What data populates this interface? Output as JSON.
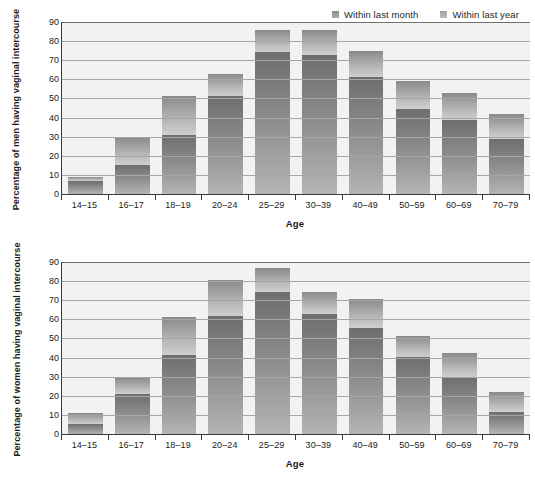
{
  "legend": {
    "items": [
      {
        "label": "Within last month",
        "key": "month",
        "color": "#8b8b89",
        "icon": "legend-swatch-icon"
      },
      {
        "label": "Within last year",
        "key": "year",
        "color": "#b9b9b7",
        "icon": "legend-swatch-icon"
      }
    ]
  },
  "chart_data": [
    {
      "type": "bar",
      "stacked": true,
      "panel": "men",
      "title": "",
      "xlabel": "Age",
      "ylabel": "Percentage of men having vaginal intercourse",
      "categories": [
        "14–15",
        "16–17",
        "18–19",
        "20–24",
        "25–29",
        "30–39",
        "40–49",
        "50–59",
        "60–69",
        "70–79"
      ],
      "ylim": [
        0,
        90
      ],
      "yticks": [
        0,
        10,
        20,
        30,
        40,
        50,
        60,
        70,
        80,
        90
      ],
      "grid": true,
      "legend_position": "top-right",
      "series": [
        {
          "name": "Within last month",
          "values": [
            7,
            15,
            31,
            51.5,
            74.5,
            72.5,
            61,
            44.5,
            38.5,
            29
          ]
        },
        {
          "name": "Within last year",
          "values": [
            9,
            30,
            51.5,
            63,
            86,
            86,
            75,
            59,
            53,
            42
          ]
        }
      ],
      "note": "'Within last year' values are cumulative bar totals; the upper lighter segment is the difference."
    },
    {
      "type": "bar",
      "stacked": true,
      "panel": "women",
      "title": "",
      "xlabel": "Age",
      "ylabel": "Percentage of women having vaginal intercourse",
      "categories": [
        "14–15",
        "16–17",
        "18–19",
        "20–24",
        "25–29",
        "30–39",
        "40–49",
        "50–59",
        "60–69",
        "70–79"
      ],
      "ylim": [
        0,
        90
      ],
      "yticks": [
        0,
        10,
        20,
        30,
        40,
        50,
        60,
        70,
        80,
        90
      ],
      "grid": true,
      "legend_position": "top-right",
      "series": [
        {
          "name": "Within last month",
          "values": [
            5,
            21,
            41.5,
            62,
            74.5,
            63,
            55.5,
            40.5,
            30,
            11.5
          ]
        },
        {
          "name": "Within last year",
          "values": [
            11,
            29.5,
            61,
            80.5,
            87,
            74.5,
            70.5,
            51.5,
            42.5,
            22
          ]
        }
      ],
      "note": "'Within last year' values are cumulative bar totals; the upper lighter segment is the difference."
    }
  ]
}
